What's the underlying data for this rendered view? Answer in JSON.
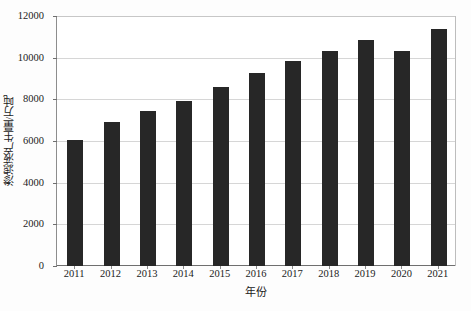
{
  "chart_data": {
    "type": "bar",
    "title": "",
    "xlabel": "年份",
    "ylabel": "渗滤液产生量/万吨",
    "categories": [
      "2011",
      "2012",
      "2013",
      "2014",
      "2015",
      "2016",
      "2017",
      "2018",
      "2019",
      "2020",
      "2021"
    ],
    "values": [
      6050,
      6930,
      7420,
      7900,
      8580,
      9270,
      9850,
      10300,
      10870,
      10320,
      11380
    ],
    "series": [
      {
        "name": "渗滤液产生量",
        "values": [
          6050,
          6930,
          7420,
          7900,
          8580,
          9270,
          9850,
          10300,
          10870,
          10320,
          11380
        ]
      }
    ],
    "ylim": [
      0,
      12000
    ],
    "yticks": [
      0,
      2000,
      4000,
      6000,
      8000,
      10000,
      12000
    ],
    "ytick_labels": [
      "0",
      "2000",
      "4000",
      "6000",
      "8000",
      "10000",
      "12000"
    ],
    "grid": true,
    "legend": "none",
    "bar_color": "#272727",
    "grid_color": "#d6d6d6",
    "axis_color": "#6f6f6f",
    "background": "#ffffff"
  }
}
